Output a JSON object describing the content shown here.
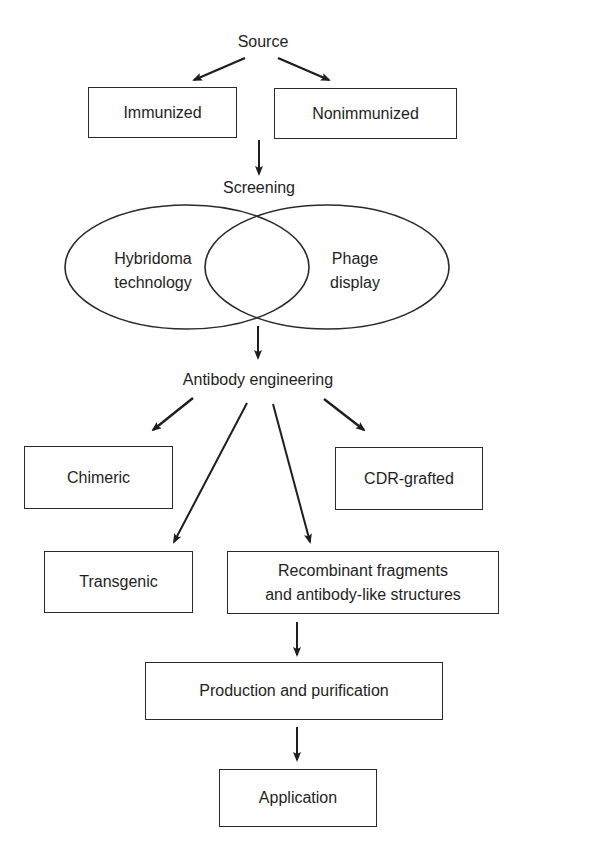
{
  "diagram": {
    "title_nodes": {
      "source": "Source",
      "screening": "Screening",
      "antibody_engineering": "Antibody engineering"
    },
    "source_options": [
      "Immunized",
      "Nonimmunized"
    ],
    "screening_methods": {
      "left": {
        "line1": "Hybridoma",
        "line2": "technology"
      },
      "right": {
        "line1": "Phage",
        "line2": "display"
      }
    },
    "engineering_outputs": {
      "chimeric": "Chimeric",
      "cdr_grafted": "CDR-grafted",
      "transgenic": "Transgenic",
      "recombinant": {
        "line1": "Recombinant fragments",
        "line2": "and antibody-like structures"
      }
    },
    "downstream": {
      "production": "Production and purification",
      "application": "Application"
    },
    "colors": {
      "line": "#2a2a2a",
      "text": "#1e1e1e",
      "background": "#ffffff"
    }
  }
}
